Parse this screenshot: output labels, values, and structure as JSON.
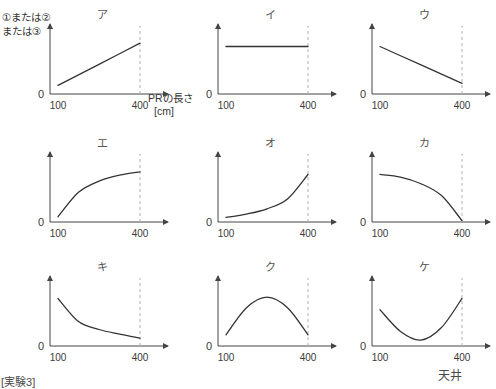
{
  "figure": {
    "y_axis_label_line1": "①または②",
    "y_axis_label_line2": "または③",
    "x_axis_label": "PRの長さ",
    "x_axis_unit": "[cm]",
    "origin_label": "0",
    "tick_min_label": "100",
    "tick_max_label": "400",
    "line_color": "#333333",
    "axis_color": "#444444",
    "dashed_color": "#b0b0b0"
  },
  "footer": {
    "left_text": "[実験3]",
    "right_text": "天井"
  },
  "chart_data": {
    "type": "line",
    "title": "",
    "xlabel": "PRの長さ [cm]",
    "ylabel": "①または②または③",
    "xlim": [
      100,
      400
    ],
    "ylim": [
      0,
      1
    ],
    "grid": false,
    "legend": "none",
    "x_ticks": [
      "100",
      "400"
    ],
    "y_ticks": [
      "0"
    ],
    "panels": [
      {
        "key": "ア",
        "label": "ア",
        "shape": "increasing-linear",
        "x": [
          100,
          175,
          250,
          325,
          400
        ],
        "values": [
          0.13,
          0.29,
          0.45,
          0.61,
          0.77
        ]
      },
      {
        "key": "イ",
        "label": "イ",
        "shape": "constant",
        "x": [
          100,
          175,
          250,
          325,
          400
        ],
        "values": [
          0.72,
          0.72,
          0.72,
          0.72,
          0.72
        ]
      },
      {
        "key": "ウ",
        "label": "ウ",
        "shape": "decreasing-linear",
        "x": [
          100,
          175,
          250,
          325,
          400
        ],
        "values": [
          0.72,
          0.58,
          0.44,
          0.3,
          0.16
        ]
      },
      {
        "key": "エ",
        "label": "エ",
        "shape": "increasing-concave-saturating",
        "x": [
          100,
          175,
          250,
          325,
          400
        ],
        "values": [
          0.08,
          0.45,
          0.62,
          0.71,
          0.76
        ]
      },
      {
        "key": "オ",
        "label": "オ",
        "shape": "increasing-convex-exponential",
        "x": [
          100,
          175,
          250,
          325,
          400
        ],
        "values": [
          0.07,
          0.12,
          0.2,
          0.35,
          0.72
        ]
      },
      {
        "key": "カ",
        "label": "カ",
        "shape": "decreasing-concave-to-zero",
        "x": [
          100,
          175,
          250,
          325,
          400
        ],
        "values": [
          0.72,
          0.68,
          0.58,
          0.4,
          0.02
        ]
      },
      {
        "key": "キ",
        "label": "キ",
        "shape": "decreasing-hyperbolic",
        "x": [
          100,
          175,
          250,
          325,
          400
        ],
        "values": [
          0.72,
          0.37,
          0.25,
          0.18,
          0.12
        ]
      },
      {
        "key": "ク",
        "label": "ク",
        "shape": "inverted-parabola",
        "x": [
          100,
          175,
          250,
          325,
          400
        ],
        "values": [
          0.17,
          0.58,
          0.74,
          0.58,
          0.17
        ]
      },
      {
        "key": "ケ",
        "label": "ケ",
        "shape": "u-parabola",
        "x": [
          100,
          175,
          250,
          325,
          400
        ],
        "values": [
          0.55,
          0.22,
          0.09,
          0.28,
          0.72
        ]
      }
    ]
  }
}
